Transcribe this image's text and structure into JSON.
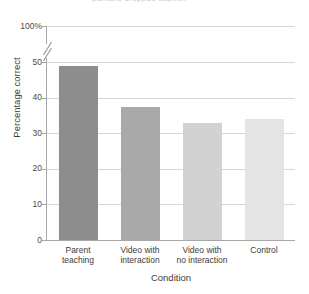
{
  "top_fragment": {
    "text": "partially cropped caption"
  },
  "chart_data": {
    "type": "bar",
    "title": "",
    "xlabel": "Condition",
    "ylabel": "Percentage correct",
    "categories": [
      "Parent teaching",
      "Video with interaction",
      "Video with no interaction",
      "Control"
    ],
    "category_lines": [
      [
        "Parent",
        "teaching"
      ],
      [
        "Video with",
        "interaction"
      ],
      [
        "Video with",
        "no interaction"
      ],
      [
        "Control",
        ""
      ]
    ],
    "values": [
      49,
      37.5,
      33,
      34
    ],
    "bar_colors": [
      "#8d8d8d",
      "#a9a9a9",
      "#d2d2d2",
      "#e4e4e4"
    ],
    "ylim": [
      0,
      100
    ],
    "y_ticks": [
      0,
      10,
      20,
      30,
      40,
      50,
      100
    ],
    "y_tick_labels": [
      "0",
      "10",
      "20",
      "30",
      "40",
      "50",
      "100%"
    ],
    "axis_break": true,
    "axis_break_between": [
      50,
      100
    ],
    "grid": true,
    "grid_color": "#d6d6d6",
    "legend": "none"
  }
}
